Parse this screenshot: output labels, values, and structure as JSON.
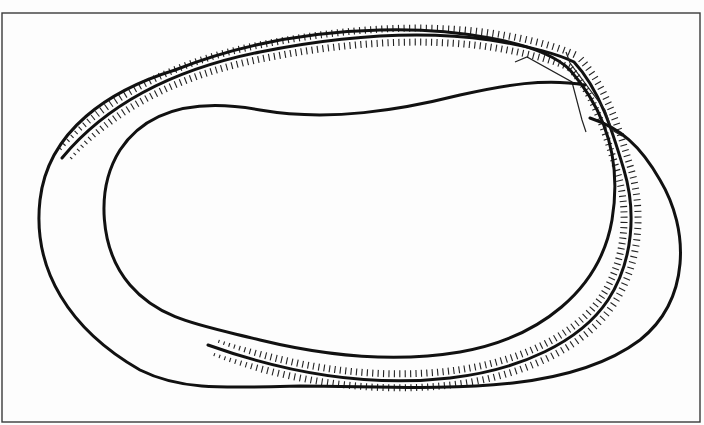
{
  "diagram": {
    "title": "",
    "background": "#fdfdfd",
    "frame": {
      "x": 2,
      "y": 13,
      "width": 698,
      "height": 409,
      "stroke": "#3a3a3a",
      "stroke_width": 1.4
    },
    "curves": [
      {
        "id": "outer-loop",
        "stroke": "#111111",
        "width": 3,
        "d": "M 175 70 C 110 90 48 130 40 200 C 32 270 70 330 140 370 C 180 390 220 388 300 386 C 420 386 560 400 640 340 C 690 300 690 230 660 180 C 640 145 620 128 590 118"
      },
      {
        "id": "inner-loop",
        "stroke": "#111111",
        "width": 3,
        "d": "M 585 85 C 545 78 505 85 460 95 C 400 110 330 122 260 110 C 205 100 150 105 120 150 C 95 190 100 250 130 285 C 160 320 200 325 260 340 C 330 357 400 362 460 352 C 540 338 600 290 612 220 C 622 160 605 110 570 70 C 540 40 450 28 380 30 C 300 32 230 48 175 70"
      }
    ],
    "hatched_curves": [
      {
        "id": "hatch-outer-side",
        "stroke": "#222222",
        "tick_width": 1.1,
        "tick_length": 7,
        "offset": 7,
        "spacing": 5.5,
        "d": "M 62 158 C 110 100 180 68 260 52 C 340 36 420 30 490 40 C 530 46 560 55 574 62 C 600 90 612 130 624 170 C 636 210 634 260 608 300 C 580 342 520 370 450 378 C 380 386 300 378 208 345"
      },
      {
        "id": "hatch-inner-side",
        "stroke": "#222222",
        "tick_width": 1.1,
        "tick_length": 7,
        "offset": -7,
        "spacing": 5.5,
        "d": "M 62 158 C 110 100 180 68 260 52 C 340 36 420 30 490 40 C 530 46 560 55 574 62 C 600 90 612 130 624 170 C 636 210 634 260 608 300 C 580 342 520 370 450 378 C 380 386 300 378 208 345"
      }
    ],
    "crossing_detail": {
      "stroke": "#222222",
      "width": 1.2,
      "segments": [
        "M 515 62 L 527 57 L 572 82 L 582 120 L 586 132",
        "M 566 52 L 570 63 L 605 110 L 612 130 L 622 136"
      ]
    },
    "labels": []
  }
}
